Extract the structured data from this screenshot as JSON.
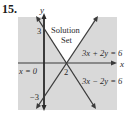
{
  "problem_number": "15.",
  "graph": {
    "axis_labels": {
      "x": "x",
      "y": "y"
    },
    "tick_labels": {
      "y_pos": "3",
      "y_neg": "−3",
      "x_int": "2"
    },
    "region_label_line1": "Solution",
    "region_label_line2": "Set",
    "lines": [
      {
        "equation": "3x + 2y = 6"
      },
      {
        "equation": "3x − 2y = 6"
      },
      {
        "equation": "x = 0"
      }
    ],
    "colors": {
      "shade": "#d9d9d9",
      "line": "#3a3a3a",
      "solution_region": "#ffffff"
    }
  }
}
